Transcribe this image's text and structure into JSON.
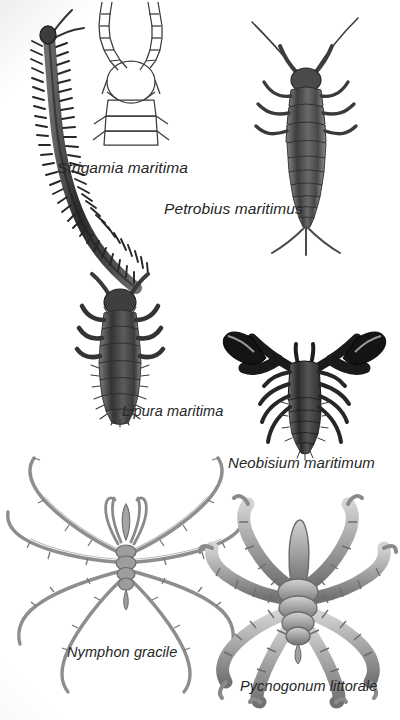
{
  "plate": {
    "title": "Marine and littoral arthropods illustration plate",
    "background_color": "#ffffff",
    "ink_color": "#262626",
    "width": 400,
    "height": 720
  },
  "specimens": [
    {
      "id": "strigamia",
      "label": "Strigamia maritima",
      "common_name": "coastal centipede",
      "group": "Chilopoda",
      "rendering": "halftone photographic, dark gray-black",
      "position": "upper-left, curving S-shape body",
      "features": [
        "elongate multi-segmented body",
        "many paired lateral legs",
        "two long head antennae"
      ]
    },
    {
      "id": "strigamia-head-detail",
      "label": "",
      "common_name": "head detail line drawing",
      "group": "Chilopoda",
      "rendering": "line art outline, no fill",
      "position": "upper-center",
      "features": [
        "segmented antennae",
        "oval head capsule",
        "rectangular trunk segments"
      ]
    },
    {
      "id": "petrobius",
      "label": "Petrobius maritimus",
      "common_name": "sea bristletail",
      "group": "Archaeognatha",
      "rendering": "halftone photographic, mid gray",
      "position": "upper-right",
      "features": [
        "two long antennae",
        "tapering segmented abdomen",
        "three caudal filaments",
        "three pairs of legs"
      ]
    },
    {
      "id": "lipura",
      "label": "Lipura maritima",
      "common_name": "seashore springtail",
      "group": "Collembola",
      "rendering": "halftone photographic, dark gray",
      "position": "middle-left",
      "features": [
        "stout segmented body",
        "short antennae",
        "bristly setae along margins"
      ]
    },
    {
      "id": "neobisium",
      "label": "Neobisium maritimum",
      "common_name": "marine pseudoscorpion",
      "group": "Pseudoscorpiones",
      "rendering": "halftone photographic, near black",
      "position": "middle-right",
      "features": [
        "two large pincer pedipalps",
        "four pairs of walking legs",
        "segmented teardrop abdomen"
      ]
    },
    {
      "id": "nymphon",
      "label": "Nymphon gracile",
      "common_name": "slender sea spider",
      "group": "Pycnogonida",
      "rendering": "fine line engraving, light gray",
      "position": "lower-left",
      "features": [
        "four pairs of very long thin legs",
        "central proboscis",
        "chelifores and palps",
        "narrow trunk"
      ]
    },
    {
      "id": "pycnogonum",
      "label": "Pycnogonum littorale",
      "common_name": "stout sea spider",
      "group": "Pycnogonida",
      "rendering": "halftone photographic, mid-light gray",
      "position": "lower-right",
      "features": [
        "thick knobbly segmented legs",
        "broad blunt proboscis",
        "short robust trunk",
        "terminal claws"
      ]
    }
  ]
}
